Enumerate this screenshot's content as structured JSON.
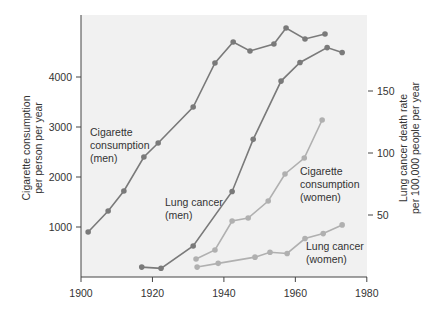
{
  "chart_data": {
    "type": "line",
    "title": "",
    "xlabel": "",
    "xlim": [
      1900,
      1980
    ],
    "xticks": [
      1900,
      1920,
      1940,
      1960,
      1980
    ],
    "y_left": {
      "label_lines": [
        "Cigarette consumption",
        "per person per year"
      ],
      "ticks": [
        1000,
        2000,
        3000,
        4000
      ],
      "range": [
        0,
        5200
      ]
    },
    "y_right": {
      "label_lines": [
        "Lung cancer death rate",
        "per 100,000 people per year"
      ],
      "ticks": [
        50,
        100,
        150
      ],
      "range": [
        0,
        210
      ]
    },
    "grid": false,
    "legend": "inline annotations",
    "series": [
      {
        "name": "Cigarette consumption (men)",
        "axis": "left",
        "color": "#7a7a7a",
        "label_lines": [
          "Cigarette",
          "consumption",
          "(men)"
        ],
        "x": [
          1902,
          1907.6,
          1912,
          1917.6,
          1921.6,
          1931.4,
          1937.5,
          1942.6,
          1947.3,
          1954,
          1957.4,
          1962.7,
          1968.3
        ],
        "values": [
          900,
          1320,
          1720,
          2400,
          2680,
          3400,
          4280,
          4700,
          4520,
          4660,
          4980,
          4760,
          4860
        ]
      },
      {
        "name": "Lung cancer (men)",
        "axis": "right",
        "color": "#7a7a7a",
        "label_lines": [
          "Lung cancer",
          "(men)"
        ],
        "x": [
          1917,
          1922.4,
          1931.4,
          1942.3,
          1948.2,
          1956,
          1961.3,
          1968.9,
          1973.1
        ],
        "values": [
          8,
          7,
          25,
          69,
          111,
          158,
          173,
          185,
          181
        ]
      },
      {
        "name": "Cigarette consumption (women)",
        "axis": "left",
        "color": "#b0b0b0",
        "label_lines": [
          "Cigarette",
          "consumption",
          "(women)"
        ],
        "x": [
          1932.2,
          1937.5,
          1942.3,
          1946.8,
          1952.4,
          1957.1,
          1962.5,
          1967.5
        ],
        "values": [
          360,
          540,
          1120,
          1180,
          1520,
          2060,
          2380,
          3140
        ]
      },
      {
        "name": "Lung cancer (women)",
        "axis": "right",
        "color": "#b0b0b0",
        "label_lines": [
          "Lung cancer",
          "(women)"
        ],
        "x": [
          1932.5,
          1938.4,
          1948.7,
          1952.9,
          1957.7,
          1962.7,
          1967.8,
          1973.1
        ],
        "values": [
          8,
          11,
          16,
          20,
          19,
          31,
          35,
          42
        ]
      }
    ]
  }
}
